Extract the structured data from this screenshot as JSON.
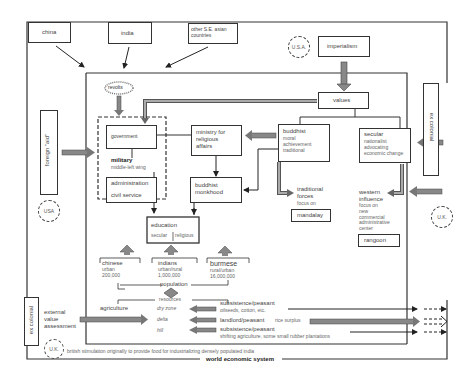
{
  "external": {
    "china": "china",
    "india": "india",
    "other_se_asian": "other S.E. asian countries",
    "imperialism": "imperialism",
    "foreign_aid": "foreign \"aid\"",
    "ex_colonial_right": "ex colonial",
    "ex_colonial_left": "ex colonial",
    "external_value_assessment": [
      "external",
      "value",
      "assessment"
    ]
  },
  "countries": {
    "usa_top": "U.S.A.",
    "usa_left": "USA",
    "uk_right": "U.K.",
    "uk_bottom": "U.K."
  },
  "core": {
    "revolts": "revolts",
    "values": "values",
    "government": "government",
    "military": "military",
    "military_sub": "middle-left wing",
    "administration": "administration",
    "civil_service": "civil service",
    "ministry": [
      "ministry for",
      "religious",
      "affairs"
    ],
    "buddhist": {
      "title": "buddhist",
      "lines": [
        "moral",
        "achievement",
        "traditional"
      ]
    },
    "secular": {
      "title": "secular",
      "lines": [
        "nationalist",
        "advocating",
        "economic change"
      ]
    },
    "monkhood": [
      "buddhist",
      "monkhood"
    ],
    "traditional_forces": {
      "title": [
        "traditional",
        "forces"
      ],
      "sub": "focus on",
      "place": "mandalay"
    },
    "western_influence": {
      "title": [
        "western",
        "influence"
      ],
      "sub": [
        "focus on",
        "new",
        "commercial",
        "administrative",
        "center"
      ],
      "place": "rangoon"
    },
    "education": {
      "title": "education",
      "secular": "secular",
      "religious": "religious"
    }
  },
  "population": {
    "label": "population",
    "groups": [
      {
        "name": "chinese",
        "type": "urban",
        "count": "200,000"
      },
      {
        "name": "indians",
        "type": "urban/rural",
        "count": "1,000,000"
      },
      {
        "name": "burmese",
        "type": "rural/urban",
        "count": "16,000,000"
      }
    ]
  },
  "resources": {
    "label": "resources",
    "agriculture": "agriculture",
    "zones": [
      {
        "zone": "dry zone",
        "type": "subsistence/peasant",
        "detail": "oilseeds, cotton, etc."
      },
      {
        "zone": "delta",
        "type": "landlord/peasant",
        "detail": "rice surplus"
      },
      {
        "zone": "hill",
        "type": "subsistence/peasant",
        "detail": "shifting agriculture, some small rubber plantations"
      }
    ],
    "footnote": "british stimulation originally to provide food for industrializing densely populated india"
  },
  "footer": {
    "world_system": "world economic system"
  }
}
